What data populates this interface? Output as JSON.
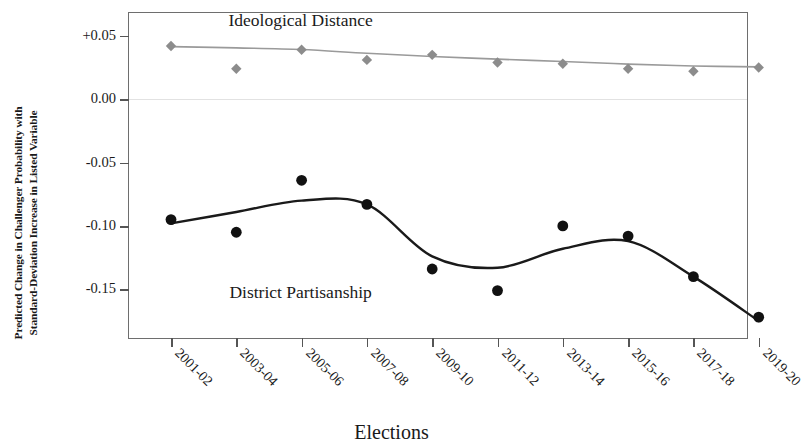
{
  "chart_data": {
    "type": "line",
    "title": "",
    "xlabel": "Elections",
    "ylabel": "Predicted Change in Challenger Probability with Standard-Deviation Increase in Listed Variable",
    "ylabel_line1": "Predicted Change in Challenger Probability with",
    "ylabel_line2": "Standard-Deviation Increase in Listed Variable",
    "categories": [
      "2001-02",
      "2003-04",
      "2005-06",
      "2007-08",
      "2009-10",
      "2011-12",
      "2013-14",
      "2015-16",
      "2017-18",
      "2019-20"
    ],
    "ytick_labels": [
      "+0.05",
      "0.00",
      "-0.05",
      "-0.10",
      "-0.15"
    ],
    "ytick_values": [
      0.05,
      0.0,
      -0.05,
      -0.1,
      -0.15
    ],
    "ylim": [
      -0.19,
      0.068
    ],
    "grid": false,
    "zero_reference_line": 0.0,
    "legend_position": "inline-annotations",
    "series": [
      {
        "name": "Ideological Distance",
        "marker": "diamond",
        "color": "#8c8c8c",
        "line_color": "#9a9a9a",
        "label_x_category": "2005-06",
        "label_y": 0.062,
        "values": [
          0.042,
          0.024,
          0.039,
          0.031,
          0.035,
          0.029,
          0.028,
          0.024,
          0.022,
          0.025
        ],
        "fit_line": [
          0.0415,
          0.0405,
          0.0392,
          0.0362,
          0.0337,
          0.0316,
          0.0297,
          0.0277,
          0.0262,
          0.0255
        ]
      },
      {
        "name": "District Partisanship",
        "marker": "circle",
        "color": "#111111",
        "line_color": "#1a1a1a",
        "label_x_category": "2005-06",
        "label_y": -0.153,
        "values": [
          -0.095,
          -0.105,
          -0.064,
          -0.083,
          -0.134,
          -0.151,
          -0.1,
          -0.108,
          -0.14,
          -0.172
        ],
        "fit_line": [
          -0.098,
          -0.089,
          -0.08,
          -0.083,
          -0.124,
          -0.133,
          -0.118,
          -0.112,
          -0.14,
          -0.175
        ]
      }
    ]
  },
  "axis": {
    "x_title": "Elections",
    "y_title_line1": "Predicted Change in Challenger Probability with",
    "y_title_line2": "Standard-Deviation Increase in Listed Variable"
  },
  "colors": {
    "gray_series": "#8c8c8c",
    "black_series": "#111111",
    "frame": "#6e6e6e",
    "zero_line": "#e2e2e2",
    "background": "#ffffff"
  }
}
